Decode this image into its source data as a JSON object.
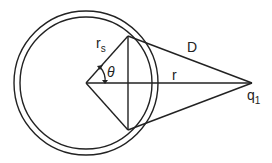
{
  "diagram": {
    "type": "geometry",
    "labels": {
      "rs_main": "r",
      "rs_sub": "s",
      "theta": "θ",
      "D": "D",
      "r": "r",
      "q_main": "q",
      "q_sub": "1"
    },
    "stroke_color": "#222222"
  }
}
